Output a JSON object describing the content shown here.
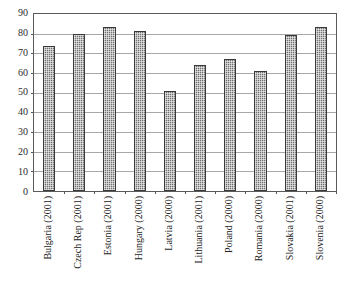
{
  "chart_data": {
    "type": "bar",
    "title": "",
    "subtitle": "",
    "xlabel": "",
    "ylabel": "",
    "ylim": [
      0,
      90
    ],
    "yticks": [
      0,
      10,
      20,
      30,
      40,
      50,
      60,
      70,
      80,
      90
    ],
    "ytick_labels": [
      "0",
      "10",
      "20",
      "30",
      "40",
      "50",
      "60",
      "70",
      "80",
      "90"
    ],
    "grid": true,
    "legend": false,
    "legend_position": "none",
    "bar_color": "#8e8e8e",
    "bar_border_color": "#3a3a3a",
    "gridline_color": "#a8a8a8",
    "frame_color": "#5a5a5a",
    "categories": [
      "Bulgaria (2001)",
      "Czech Rep (2001)",
      "Estonia (2001)",
      "Hungary (2000)",
      "Latvia (2000)",
      "Lithuania (2001)",
      "Poland (2000)",
      "Romania (2000)",
      "Slovakia (2001)",
      "Slovenia (2000)"
    ],
    "values": [
      73.5,
      79.8,
      83.5,
      81.5,
      51.0,
      64.0,
      67.0,
      61.0,
      79.5,
      83.5
    ]
  }
}
